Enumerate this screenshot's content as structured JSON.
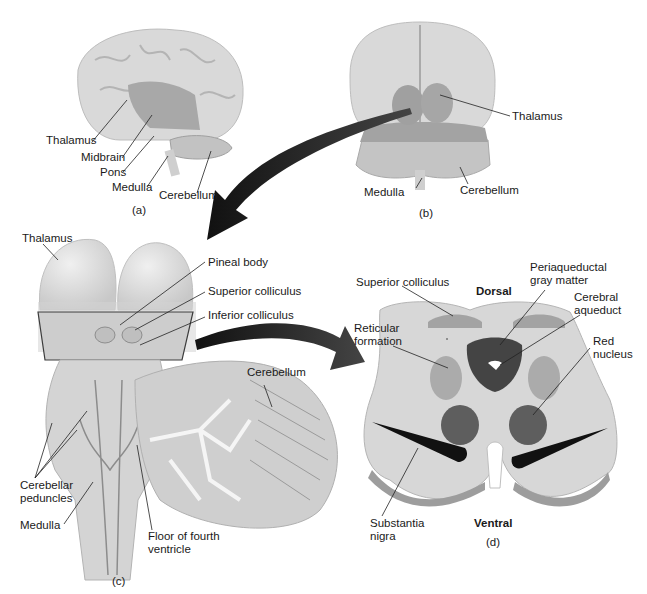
{
  "figure": {
    "panels": {
      "a": {
        "caption": "(a)",
        "view": "lateral view of brain",
        "labels": {
          "thalamus": "Thalamus",
          "midbrain": "Midbrain",
          "pons": "Pons",
          "medulla": "Medulla",
          "cerebellum": "Cerebellum"
        }
      },
      "b": {
        "caption": "(b)",
        "view": "posterior view of brain",
        "labels": {
          "thalamus": "Thalamus",
          "medulla": "Medulla",
          "cerebellum": "Cerebellum"
        }
      },
      "c": {
        "caption": "(c)",
        "view": "dorsal view of brainstem",
        "labels": {
          "thalamus": "Thalamus",
          "pineal_body": "Pineal body",
          "superior_colliculus": "Superior colliculus",
          "inferior_colliculus": "Inferior colliculus",
          "cerebellum": "Cerebellum",
          "cerebellar_peduncles": "Cerebellar\npeduncles",
          "medulla": "Medulla",
          "floor_fourth_ventricle": "Floor of fourth\nventricle"
        }
      },
      "d": {
        "caption": "(d)",
        "view": "cross section of midbrain",
        "labels": {
          "dorsal": "Dorsal",
          "ventral": "Ventral",
          "superior_colliculus": "Superior colliculus",
          "periaqueductal": "Periaqueductal\ngray matter",
          "cerebral_aqueduct": "Cerebral\naqueduct",
          "reticular_formation": "Reticular\nformation",
          "red_nucleus": "Red\nnucleus",
          "substantia_nigra": "Substantia\nnigra"
        }
      }
    },
    "colors": {
      "tissue_light": "#d6d6d6",
      "tissue_mid": "#a9a9a9",
      "tissue_dark": "#5a5a5a",
      "black": "#111111",
      "arrow": "#1c1c1c"
    }
  }
}
